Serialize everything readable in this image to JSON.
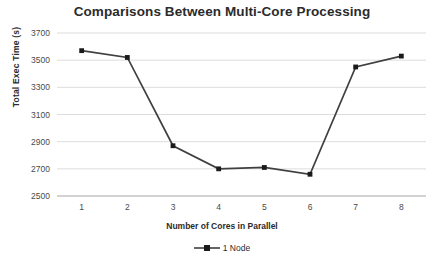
{
  "chart_data": {
    "type": "line",
    "title": "Comparisons Between Multi-Core Processing",
    "xlabel": "Number of Cores in Parallel",
    "ylabel": "Total Exec Time (s)",
    "categories": [
      "1",
      "2",
      "3",
      "4",
      "5",
      "6",
      "7",
      "8"
    ],
    "series": [
      {
        "name": "1 Node",
        "values": [
          3570,
          3520,
          2870,
          2700,
          2710,
          2660,
          3450,
          3530
        ]
      }
    ],
    "ylim": [
      2500,
      3700
    ],
    "yticks": [
      2500,
      2700,
      2900,
      3100,
      3300,
      3500,
      3700
    ],
    "ytick_labels": [
      "2500",
      "2700",
      "2900",
      "3100",
      "3300",
      "3500",
      "3700"
    ],
    "grid": true,
    "grid_axis": "y",
    "legend_position": "bottom",
    "line_color": "#404040",
    "marker_color": "#1a1a1a",
    "grid_color": "#d9d9d9",
    "axis_color": "#a6a6a6",
    "background": "#ffffff"
  },
  "legend": {
    "entries": [
      {
        "label": "1 Node",
        "color": "#404040"
      }
    ]
  }
}
